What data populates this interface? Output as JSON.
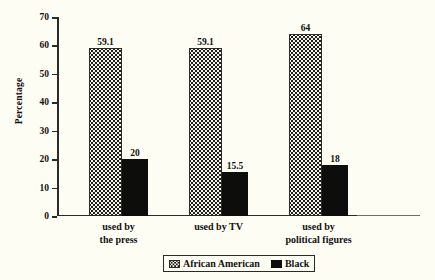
{
  "chart_data": {
    "type": "bar",
    "title": "",
    "xlabel": "",
    "ylabel": "Percentage",
    "ylim": [
      0,
      70
    ],
    "ytick_step": 10,
    "yticks": [
      70,
      60,
      50,
      40,
      30,
      20,
      10,
      0
    ],
    "grid": false,
    "legend_position": "bottom-center",
    "categories": [
      "used by the press",
      "used by TV",
      "used by political figures"
    ],
    "category_lines": [
      [
        "used by",
        "the press"
      ],
      [
        "used by TV",
        ""
      ],
      [
        "used by",
        "political figures"
      ]
    ],
    "series": [
      {
        "name": "African American",
        "values": [
          59.1,
          59.1,
          64
        ],
        "value_labels": [
          "59.1",
          "59.1",
          "64"
        ],
        "fill": "dotted-pattern",
        "color": "#f4f3ea"
      },
      {
        "name": "Black",
        "values": [
          20,
          15.5,
          18
        ],
        "value_labels": [
          "20",
          "15.5",
          "18"
        ],
        "fill": "solid",
        "color": "#0d0d0b"
      }
    ]
  },
  "colors": {
    "background": "#fdfdf4",
    "axis": "#2a2a26",
    "text": "#111111",
    "series_african_american": "#f4f3ea",
    "series_black": "#0d0d0b"
  }
}
